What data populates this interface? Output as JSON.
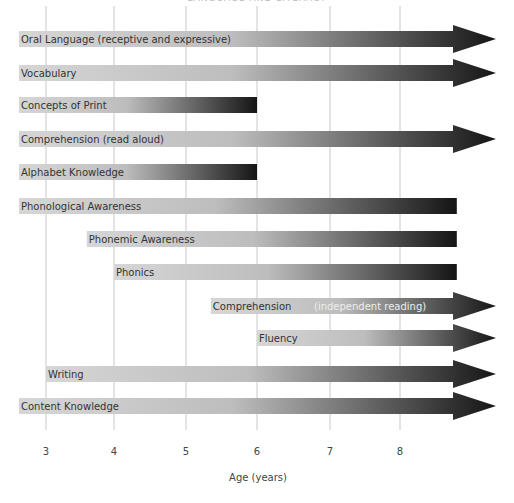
{
  "header": {
    "title": "LANGUAGE AND LITERACY"
  },
  "chart_data": {
    "type": "timeline",
    "xlabel": "Age (years)",
    "x_ticks": [
      3,
      4,
      5,
      6,
      7,
      8
    ],
    "x_range": [
      2.6,
      9.0
    ],
    "bars": [
      {
        "label": "Oral Language (receptive and expressive)",
        "start": "before 3",
        "end": "beyond 8",
        "arrow": true
      },
      {
        "label": "Vocabulary",
        "start": "before 3",
        "end": "beyond 8",
        "arrow": true
      },
      {
        "label": "Concepts of Print",
        "start": "before 3",
        "end": 6,
        "arrow": false
      },
      {
        "label": "Comprehension (read aloud)",
        "start": "before 3",
        "end": "beyond 8",
        "arrow": true
      },
      {
        "label": "Alphabet Knowledge",
        "start": "before 3",
        "end": 6,
        "arrow": false
      },
      {
        "label": "Phonological Awareness",
        "start": "before 3",
        "end": 8.8,
        "arrow": false
      },
      {
        "label": "Phonemic Awareness",
        "start": 3.6,
        "end": 8.8,
        "arrow": false
      },
      {
        "label": "Phonics",
        "start": 4,
        "end": 8.8,
        "arrow": false
      },
      {
        "label": "Comprehension",
        "sublabel": "(independent reading)",
        "start": 5.35,
        "end": "beyond 8",
        "arrow": true
      },
      {
        "label": "Fluency",
        "start": 6,
        "end": "beyond 8",
        "arrow": true
      },
      {
        "label": "Writing",
        "start": 3,
        "end": "beyond 8",
        "arrow": true
      },
      {
        "label": "Content Knowledge",
        "start": "before 3",
        "end": "beyond 8",
        "arrow": true
      }
    ],
    "colors": {
      "gradient_start": "#d4d4d4",
      "gradient_end": "#1a1a1a",
      "gridline": "#c8c8c8"
    }
  }
}
